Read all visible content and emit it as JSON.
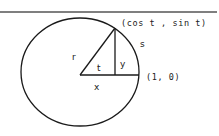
{
  "diagram": {
    "colors": {
      "line": "#1a1a1a",
      "rule": "#555555",
      "text": "#222222",
      "background": "#ffffff"
    },
    "labels": {
      "point_on_circle": "(cos t , sin t)",
      "arc_length": "s",
      "radius": "r",
      "angle": "t",
      "opposite_side": "y",
      "reference_point": "(1, 0)",
      "adjacent_side": "x"
    }
  }
}
